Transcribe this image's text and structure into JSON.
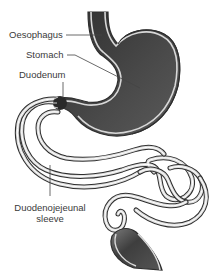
{
  "diagram": {
    "labels": {
      "oesophagus": "Oesophagus",
      "stomach": "Stomach",
      "duodenum": "Duodenum",
      "sleeve_line1": "Duodenojejeunal",
      "sleeve_line2": "sleeve"
    },
    "colors": {
      "organ_fill": "#3f3f3f",
      "organ_fill_light": "#6a6a6a",
      "wall_outline": "#333333",
      "wall_inner": "#d8d8d8",
      "leader_line": "#444444",
      "text": "#3a3a3a",
      "background": "#ffffff"
    }
  }
}
